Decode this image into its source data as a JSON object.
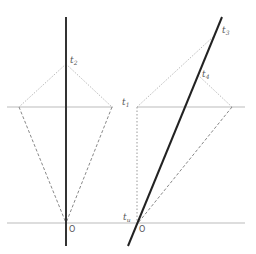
{
  "diagram": {
    "colors": {
      "worldline": "#222222",
      "axis_lines": "#bbbbbb",
      "dotted": "#bbbbbb",
      "dashed": "#888888"
    },
    "labels": {
      "t2": {
        "base": "t",
        "sub": "2"
      },
      "t1": {
        "base": "t",
        "sub": "1"
      },
      "t3": {
        "base": "t",
        "sub": "3"
      },
      "t4": {
        "base": "t",
        "sub": "4"
      },
      "tu": {
        "base": "t",
        "sub": "u"
      },
      "origin_left": "O",
      "origin_right": "O"
    }
  }
}
